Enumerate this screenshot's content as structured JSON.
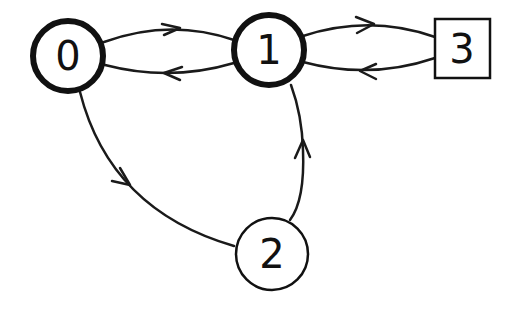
{
  "diagram": {
    "type": "state-graph",
    "nodes": [
      {
        "id": "0",
        "label": "0",
        "shape": "circle",
        "emphasis": "thick"
      },
      {
        "id": "1",
        "label": "1",
        "shape": "circle",
        "emphasis": "thick"
      },
      {
        "id": "2",
        "label": "2",
        "shape": "circle",
        "emphasis": "thin"
      },
      {
        "id": "3",
        "label": "3",
        "shape": "square",
        "emphasis": "thin"
      }
    ],
    "edges": [
      {
        "from": "0",
        "to": "1"
      },
      {
        "from": "1",
        "to": "0"
      },
      {
        "from": "1",
        "to": "3"
      },
      {
        "from": "3",
        "to": "1"
      },
      {
        "from": "0",
        "to": "2"
      },
      {
        "from": "2",
        "to": "1"
      }
    ]
  }
}
